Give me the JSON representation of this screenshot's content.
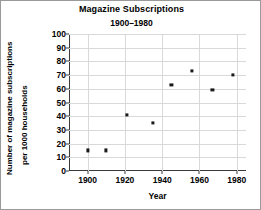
{
  "chart_data": {
    "type": "scatter",
    "title": "Magazine Subscriptions",
    "subtitle": "1900–1980",
    "xlabel": "Year",
    "ylabel_line1": "Number of magazine subscriptions",
    "ylabel_line2": "per 1000 households",
    "xlim": [
      1890,
      1985
    ],
    "ylim": [
      0,
      100
    ],
    "xticks": [
      1900,
      1920,
      1940,
      1960,
      1980
    ],
    "yticks": [
      0,
      10,
      20,
      30,
      40,
      50,
      60,
      70,
      80,
      90,
      100
    ],
    "grid": true,
    "legend": null,
    "marker_color": "#1a1a1a",
    "grid_color": "#d9d9d9",
    "axis_color": "#3a3a3a",
    "x": [
      1900,
      1910,
      1921,
      1935,
      1945,
      1956,
      1967,
      1978
    ],
    "y": [
      15,
      15,
      41,
      35,
      63,
      73,
      59,
      70
    ],
    "points": [
      {
        "x": 1900,
        "y": 15
      },
      {
        "x": 1910,
        "y": 15
      },
      {
        "x": 1921,
        "y": 41
      },
      {
        "x": 1935,
        "y": 35
      },
      {
        "x": 1945,
        "y": 63
      },
      {
        "x": 1956,
        "y": 73
      },
      {
        "x": 1967,
        "y": 59
      },
      {
        "x": 1978,
        "y": 70
      }
    ]
  }
}
